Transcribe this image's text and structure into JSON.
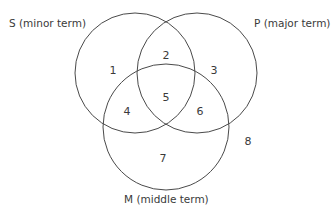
{
  "diagram": {
    "type": "venn",
    "circles": [
      {
        "id": "S",
        "label": "S (minor term)",
        "cx": 135,
        "cy": 73,
        "r": 60
      },
      {
        "id": "P",
        "label": "P (major term)",
        "cx": 197,
        "cy": 73,
        "r": 60
      },
      {
        "id": "M",
        "label": "M (middle term)",
        "cx": 166,
        "cy": 127,
        "r": 63
      }
    ],
    "regions": [
      {
        "label": "1",
        "x": 113,
        "y": 70
      },
      {
        "label": "2",
        "x": 166,
        "y": 55
      },
      {
        "label": "3",
        "x": 214,
        "y": 70
      },
      {
        "label": "4",
        "x": 127,
        "y": 111
      },
      {
        "label": "5",
        "x": 166,
        "y": 97
      },
      {
        "label": "6",
        "x": 200,
        "y": 111
      },
      {
        "label": "7",
        "x": 163,
        "y": 158
      },
      {
        "label": "8",
        "x": 248,
        "y": 141
      }
    ],
    "stroke_color": "#4a4a4a"
  }
}
